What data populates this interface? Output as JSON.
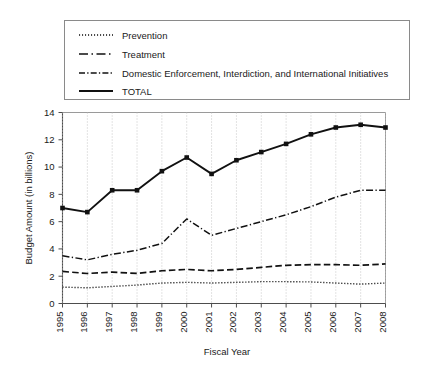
{
  "chart_data": {
    "type": "line",
    "title": "",
    "xlabel": "Fiscal Year",
    "ylabel": "Budget Amount (in billions)",
    "x": [
      1995,
      1996,
      1997,
      1998,
      1999,
      2000,
      2001,
      2002,
      2003,
      2004,
      2005,
      2006,
      2007,
      2008
    ],
    "xticklabels": [
      "1995",
      "1996",
      "1997",
      "1998",
      "1999",
      "2000",
      "2001",
      "2002",
      "2003",
      "2004",
      "2005",
      "2006",
      "2007",
      "2008"
    ],
    "yticklabels": [
      "0",
      "2",
      "4",
      "6",
      "8",
      "10",
      "12",
      "14"
    ],
    "ylim": [
      0,
      14
    ],
    "yticks": [
      0,
      2,
      4,
      6,
      8,
      10,
      12,
      14
    ],
    "grid": "vertical-dotted",
    "legend_position": "above-plot",
    "series": [
      {
        "name": "Prevention",
        "style": "dotted",
        "markers": false,
        "values": [
          1.2,
          1.15,
          1.25,
          1.35,
          1.5,
          1.55,
          1.5,
          1.55,
          1.6,
          1.6,
          1.58,
          1.5,
          1.42,
          1.5
        ]
      },
      {
        "name": "Treatment",
        "style": "dashed",
        "markers": false,
        "values": [
          2.35,
          2.2,
          2.3,
          2.2,
          2.4,
          2.5,
          2.4,
          2.5,
          2.65,
          2.8,
          2.85,
          2.85,
          2.8,
          2.9
        ]
      },
      {
        "name": "Domestic Enforcement, Interdiction, and International Initiatives",
        "style": "dash-dot",
        "markers": false,
        "values": [
          3.5,
          3.2,
          3.6,
          3.9,
          4.4,
          6.2,
          5.0,
          5.5,
          6.0,
          6.5,
          7.1,
          7.8,
          8.3,
          8.3
        ]
      },
      {
        "name": "TOTAL",
        "style": "solid",
        "markers": true,
        "values": [
          7.0,
          6.7,
          8.3,
          8.3,
          9.7,
          10.7,
          9.5,
          10.5,
          11.1,
          11.7,
          12.4,
          12.9,
          13.1,
          12.9
        ]
      }
    ]
  },
  "legend": {
    "items": [
      {
        "label": "Prevention",
        "style": "dotted"
      },
      {
        "label": "Treatment",
        "style": "dashed"
      },
      {
        "label": "Domestic Enforcement, Interdiction, and International Initiatives",
        "style": "dash-dot"
      },
      {
        "label": "TOTAL",
        "style": "solid"
      }
    ]
  }
}
